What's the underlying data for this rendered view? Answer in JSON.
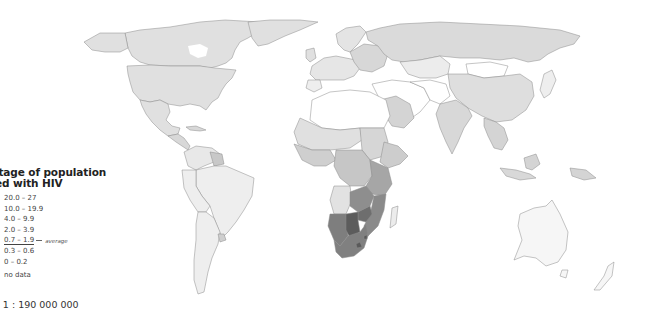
{
  "legend": {
    "title_line1": "entage of population",
    "title_line2": "cted with HIV",
    "classes": [
      {
        "range": "20.0 – 27",
        "color": "#5a5a5a"
      },
      {
        "range": "10.0 – 19.9",
        "color": "#7c7c7c"
      },
      {
        "range": "4.0 – 9.9",
        "color": "#9e9e9e"
      },
      {
        "range": "2.0 – 3.9",
        "color": "#bbbbbb"
      },
      {
        "range": "0.7 – 1.9",
        "color": "#d1d1d1"
      },
      {
        "range": "0.3 – 0.6",
        "color": "#e0e0e0"
      },
      {
        "range": "0 – 0.2",
        "color": "#efefef"
      }
    ],
    "average_label": "average",
    "no_data_label": "no data",
    "no_data_color": "#ffffff"
  },
  "scale": {
    "label": "e 1 : 190 000 000"
  },
  "map": {
    "subject": "Percentage of population infected with HIV",
    "type": "choropleth world map"
  }
}
